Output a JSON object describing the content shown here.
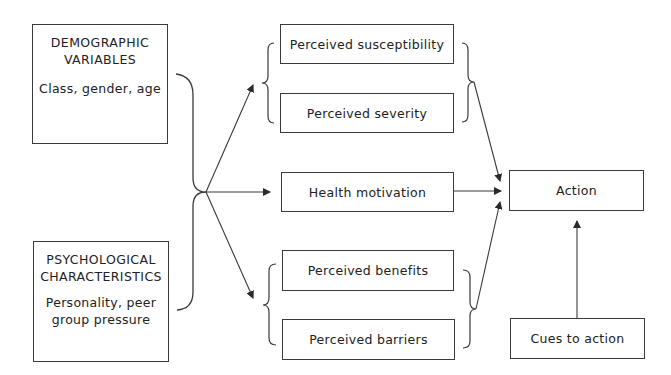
{
  "diagram": {
    "inputs": [
      {
        "heading_line1": "DEMOGRAPHIC",
        "heading_line2": "VARIABLES",
        "detail_line1": "Class, gender, age",
        "detail_line2": ""
      },
      {
        "heading_line1": "PSYCHOLOGICAL",
        "heading_line2": "CHARACTERISTICS",
        "detail_line1": "Personality, peer",
        "detail_line2": "group pressure"
      }
    ],
    "threat_group": [
      {
        "label": "Perceived susceptibility"
      },
      {
        "label": "Perceived severity"
      }
    ],
    "motivation": {
      "label": "Health motivation"
    },
    "evaluation_group": [
      {
        "label": "Perceived benefits"
      },
      {
        "label": "Perceived barriers"
      }
    ],
    "outcome": {
      "label": "Action"
    },
    "cues": {
      "label": "Cues to action"
    },
    "colors": {
      "line": "#3a3a3a",
      "text": "#222222",
      "background": "#ffffff"
    }
  }
}
